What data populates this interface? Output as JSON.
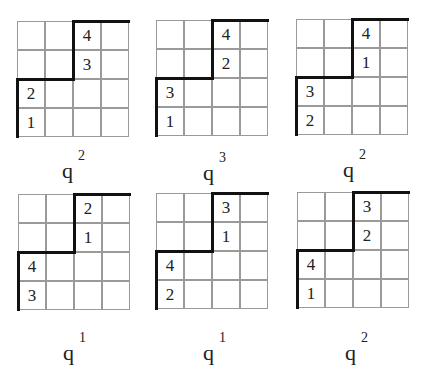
{
  "figure": {
    "rows": 4,
    "cols": 4,
    "panels": [
      {
        "cells": {
          "r0c2": "4",
          "r1c2": "3",
          "r2c0": "2",
          "r3c0": "1"
        },
        "weight_base": "q",
        "weight_exp": "2"
      },
      {
        "cells": {
          "r0c2": "4",
          "r1c2": "2",
          "r2c0": "3",
          "r3c0": "1"
        },
        "weight_base": "q",
        "weight_exp": "3"
      },
      {
        "cells": {
          "r0c2": "4",
          "r1c2": "1",
          "r2c0": "3",
          "r3c0": "2"
        },
        "weight_base": "q",
        "weight_exp": "2"
      },
      {
        "cells": {
          "r0c2": "2",
          "r1c2": "1",
          "r2c0": "4",
          "r3c0": "3"
        },
        "weight_base": "q",
        "weight_exp": "1"
      },
      {
        "cells": {
          "r0c2": "3",
          "r1c2": "1",
          "r2c0": "4",
          "r3c0": "2"
        },
        "weight_base": "q",
        "weight_exp": "1"
      },
      {
        "cells": {
          "r0c2": "3",
          "r1c2": "2",
          "r2c0": "4",
          "r3c0": "1"
        },
        "weight_base": "q",
        "weight_exp": "2"
      }
    ]
  }
}
